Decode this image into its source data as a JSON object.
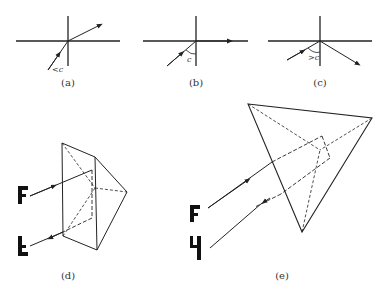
{
  "figure": {
    "panels": [
      {
        "id": "a",
        "label": "(a)",
        "angle_label": "<c",
        "description": "Refraction: incident angle less than critical angle, ray refracts out"
      },
      {
        "id": "b",
        "label": "(b)",
        "angle_label": "c",
        "description": "Incident at critical angle, refracted ray grazes the surface"
      },
      {
        "id": "c",
        "label": "(c)",
        "angle_label": ">c",
        "description": "Incident angle greater than critical angle, total internal reflection"
      },
      {
        "id": "d",
        "label": "(d)",
        "description": "Right-angle prism retro-reflecting an image (inverted F)"
      },
      {
        "id": "e",
        "label": "(e)",
        "description": "Corner-cube prism retro-reflecting an image (rotated F)"
      }
    ],
    "glyphs": {
      "d_in": "F",
      "d_out": "F",
      "e_in": "F",
      "e_out": "F"
    },
    "colors": {
      "line": "#222222",
      "background": "#ffffff"
    }
  }
}
